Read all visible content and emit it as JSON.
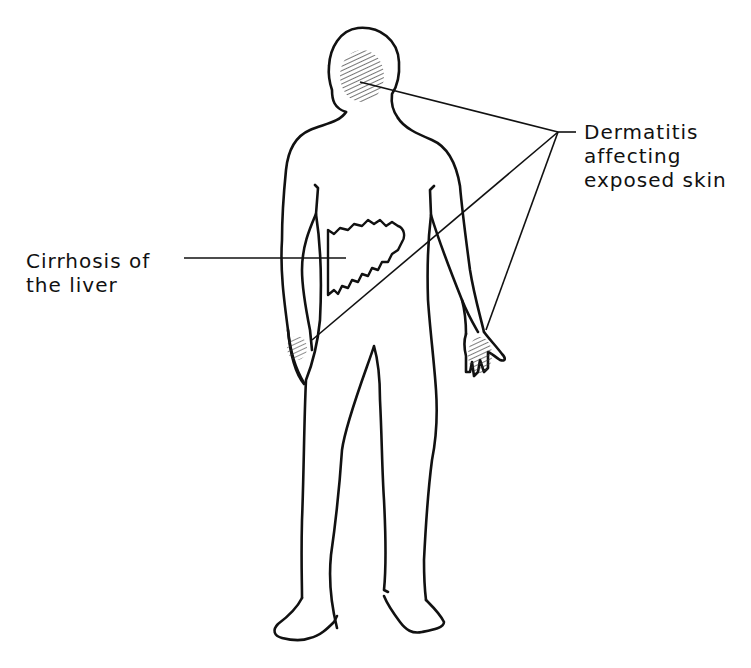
{
  "diagram": {
    "labels": {
      "dermatitis": {
        "lines": [
          "Dermatitis",
          "affecting",
          "exposed skin"
        ],
        "targets": [
          "face",
          "right-wrist",
          "left-hand"
        ]
      },
      "cirrhosis": {
        "lines": [
          "Cirrhosis of",
          "the liver"
        ],
        "targets": [
          "liver"
        ]
      }
    },
    "colors": {
      "ink": "#111111",
      "background": "#ffffff",
      "shading": "#444444"
    }
  }
}
